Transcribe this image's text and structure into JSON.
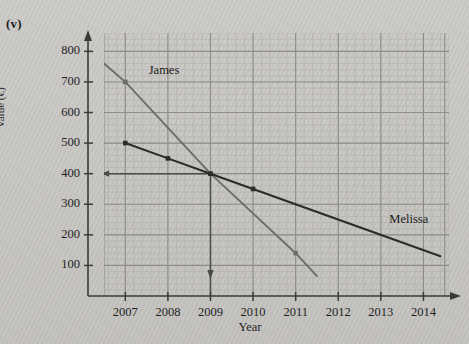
{
  "figure": {
    "part_label": "(v)",
    "colors": {
      "background": "#c9c8c4",
      "grid_minor": "#b4b3ae",
      "grid_major": "#8e8d88",
      "axis": "#3a3a3a",
      "james_line": "#6d6d6d",
      "melissa_line": "#2b2b2b",
      "construction_line": "#4a4a4a"
    }
  },
  "chart_data": {
    "type": "line",
    "title": "",
    "xlabel": "Year",
    "ylabel": "Value (€)",
    "grid": true,
    "legend": "inline-labels",
    "xlim": [
      2006.5,
      2014.6
    ],
    "ylim": [
      0,
      860
    ],
    "xticks": [
      "2007",
      "2008",
      "2009",
      "2010",
      "2011",
      "2012",
      "2013",
      "2014"
    ],
    "yticks": [
      "100",
      "200",
      "300",
      "400",
      "500",
      "600",
      "700",
      "800"
    ],
    "x_tick_values": [
      2007,
      2008,
      2009,
      2010,
      2011,
      2012,
      2013,
      2014
    ],
    "y_tick_values": [
      100,
      200,
      300,
      400,
      500,
      600,
      700,
      800
    ],
    "series": [
      {
        "name": "James",
        "label": "James",
        "color": "#6d6d6d",
        "x": [
          2006.5,
          2007,
          2009,
          2011,
          2011.5
        ],
        "y": [
          760,
          700,
          400,
          140,
          65
        ],
        "markers": [
          {
            "x": 2007,
            "y": 700
          },
          {
            "x": 2009,
            "y": 400
          },
          {
            "x": 2011,
            "y": 140
          }
        ],
        "label_position": {
          "x": 2007.55,
          "y": 735
        }
      },
      {
        "name": "Melissa",
        "label": "Melissa",
        "color": "#2b2b2b",
        "x": [
          2007,
          2008,
          2009,
          2010,
          2014.4
        ],
        "y": [
          500,
          450,
          400,
          350,
          130
        ],
        "markers": [
          {
            "x": 2007,
            "y": 500
          },
          {
            "x": 2008,
            "y": 450
          },
          {
            "x": 2009,
            "y": 400
          },
          {
            "x": 2010,
            "y": 350
          }
        ],
        "label_position": {
          "x": 2013.2,
          "y": 250
        }
      }
    ],
    "annotations": [
      {
        "name": "intersection-point",
        "x": 2009,
        "y": 400,
        "note": "James and Melissa lines cross"
      },
      {
        "name": "horizontal-construction-arrow",
        "from": {
          "x": 2009,
          "y": 400
        },
        "to": {
          "x": 2006.5,
          "y": 400
        },
        "arrow": "left"
      },
      {
        "name": "vertical-construction-arrow",
        "from": {
          "x": 2009,
          "y": 400
        },
        "to": {
          "x": 2009,
          "y": 0
        },
        "arrow": "down"
      }
    ]
  }
}
